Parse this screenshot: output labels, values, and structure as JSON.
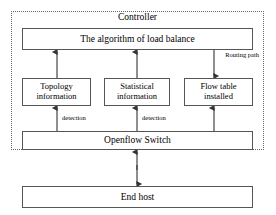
{
  "diagram": {
    "zone": {
      "name": "Controller",
      "label": "Controller"
    },
    "nodes": {
      "algorithm": {
        "label": "The algorithm of load balance"
      },
      "topology": {
        "line1": "Topology",
        "line2": "information"
      },
      "statistical": {
        "line1": "Statistical",
        "line2": "information"
      },
      "flowtable": {
        "line1": "Flow table",
        "line2": "installed"
      },
      "switch": {
        "label": "Openflow Switch"
      },
      "endhost": {
        "label": "End host"
      }
    },
    "edge_labels": {
      "routing": {
        "line1": "Routing",
        "line2": "path"
      },
      "detection_left": "detection",
      "detection_right": "detection"
    },
    "colors": {
      "box_stroke": "#555555",
      "zone_stroke": "#666666",
      "arrow": "#333333",
      "background": "#ffffff",
      "text": "#000000"
    }
  }
}
